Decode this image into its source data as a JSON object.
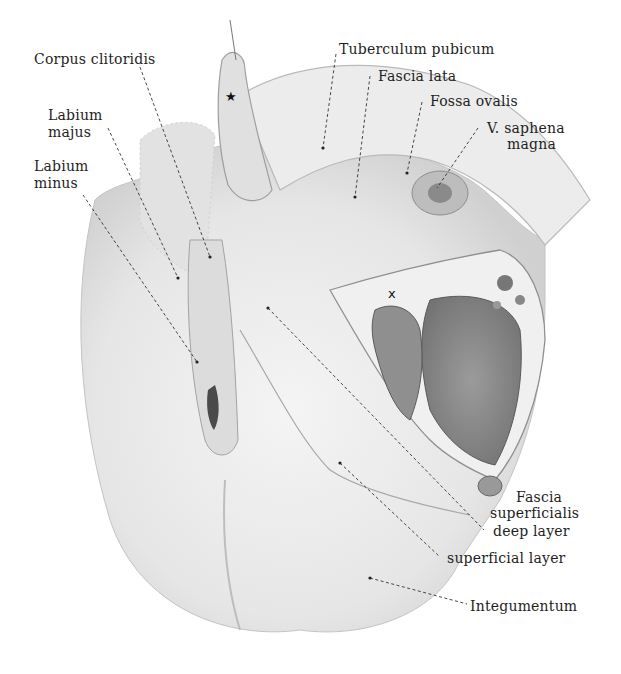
{
  "figure": {
    "type": "anatomical-illustration",
    "labels": {
      "corpus_clitoridis": "Corpus clitoridis",
      "labium_majus_1": "Labium",
      "labium_majus_2": "majus",
      "labium_minus_1": "Labium",
      "labium_minus_2": "minus",
      "tuberculum_pubicum": "Tuberculum pubicum",
      "fascia_lata": "Fascia lata",
      "fossa_ovalis": "Fossa ovalis",
      "v_saphena_1": "V. saphena",
      "v_saphena_2": "magna",
      "fascia_superficialis_1": "Fascia",
      "fascia_superficialis_2": "superficialis",
      "deep_layer": "deep layer",
      "superficial_layer": "superficial layer",
      "integumentum": "Integumentum"
    },
    "markers": {
      "star": "★",
      "x": "x"
    },
    "colors": {
      "background": "#ffffff",
      "ink": "#1e1e1e",
      "skin": "#e9e9e9",
      "muscle": "#8d8d8d",
      "shadow": "#b5b5b5"
    }
  }
}
